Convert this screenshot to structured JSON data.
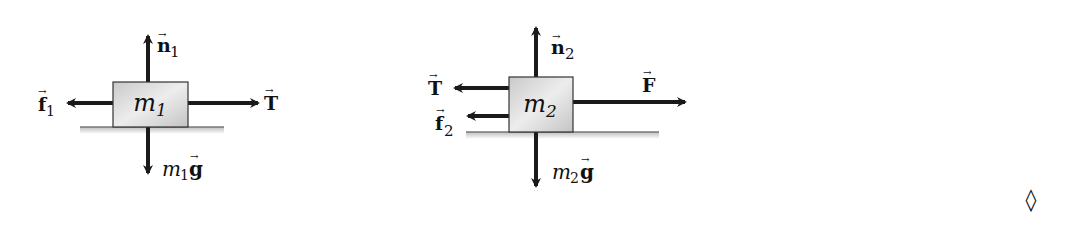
{
  "diagrams": [
    {
      "name": "free-body-diagram-block-1",
      "block_label": {
        "base": "m",
        "sub": "1"
      },
      "forces": {
        "up": {
          "base": "n",
          "sub": "1",
          "vector": true
        },
        "down": {
          "base": "m",
          "sub": "1",
          "tail": "g",
          "vector": true
        },
        "left": {
          "base": "f",
          "sub": "1",
          "vector": true
        },
        "right": {
          "base": "T",
          "sub": "",
          "vector": true
        }
      }
    },
    {
      "name": "free-body-diagram-block-2",
      "block_label": {
        "base": "m",
        "sub": "2"
      },
      "forces": {
        "up": {
          "base": "n",
          "sub": "2",
          "vector": true
        },
        "down": {
          "base": "m",
          "sub": "2",
          "tail": "g",
          "vector": true
        },
        "left_top": {
          "base": "T",
          "sub": "",
          "vector": true
        },
        "left_bottom": {
          "base": "f",
          "sub": "2",
          "vector": true
        },
        "right": {
          "base": "F",
          "sub": "",
          "vector": true
        }
      }
    }
  ],
  "end_marker": "◊",
  "colors": {
    "arrow": "#1a1a1a",
    "block_fill": "#d4d4d4",
    "block_stroke": "#333333",
    "ground": "#777777"
  }
}
